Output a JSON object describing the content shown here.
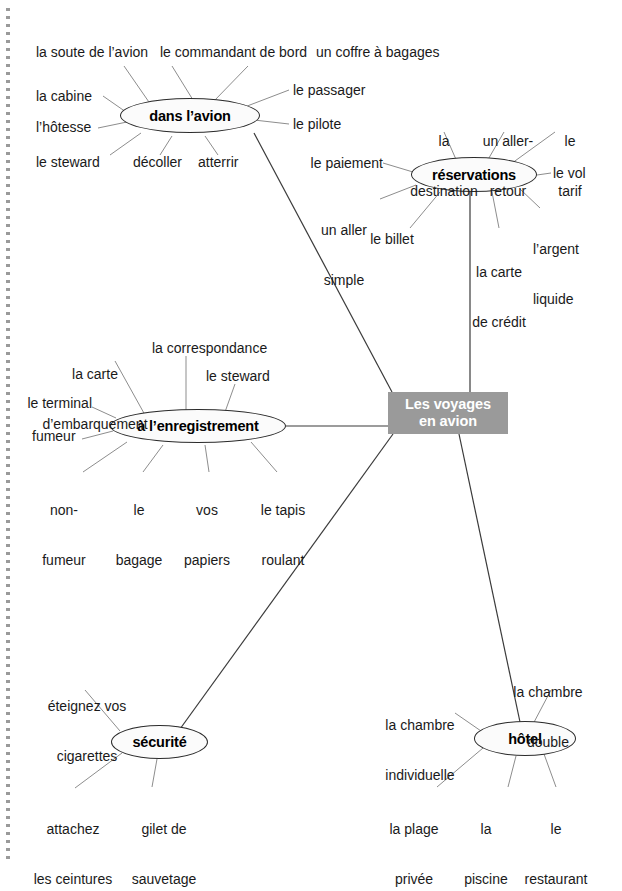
{
  "diagram": {
    "title_node": {
      "label": "Les voyages\nen avion",
      "line1": "Les voyages",
      "line2": "en avion",
      "color": "#9a9a9a",
      "text_color": "#ffffff"
    },
    "branches": [
      {
        "id": "dans-lavion",
        "label": "dans l’avion",
        "leaves": [
          {
            "text": "la soute de l’avion"
          },
          {
            "text": "le commandant de bord"
          },
          {
            "text": "un coffre à bagages"
          },
          {
            "text": "la cabine"
          },
          {
            "text": "l’hôtesse"
          },
          {
            "text": "le steward"
          },
          {
            "text": "décoller"
          },
          {
            "text": "atterrir"
          },
          {
            "text": "le passager"
          },
          {
            "text": "le pilote"
          }
        ]
      },
      {
        "id": "reservations",
        "label": "réservations",
        "leaves": [
          {
            "text": "la\ndestination",
            "line1": "la",
            "line2": "destination"
          },
          {
            "text": "un aller-\nretour",
            "line1": "un aller-",
            "line2": "retour"
          },
          {
            "text": "le\ntarif",
            "line1": "le",
            "line2": "tarif"
          },
          {
            "text": "le paiement"
          },
          {
            "text": "un aller\nsimple",
            "line1": "un aller",
            "line2": "simple"
          },
          {
            "text": "le billet"
          },
          {
            "text": "la carte\nde crédit",
            "line1": "la carte",
            "line2": "de crédit"
          },
          {
            "text": "l’argent\nliquide",
            "line1": "l’argent",
            "line2": "liquide"
          },
          {
            "text": "le vol"
          }
        ]
      },
      {
        "id": "a-lenregistrement",
        "label": "à l’enregistrement",
        "leaves": [
          {
            "text": "la carte\nd’embarquement",
            "line1": "la carte",
            "line2": "d’embarquement"
          },
          {
            "text": "la correspondance"
          },
          {
            "text": "le steward"
          },
          {
            "text": "le terminal"
          },
          {
            "text": "fumeur"
          },
          {
            "text": "non-\nfumeur",
            "line1": "non-",
            "line2": "fumeur"
          },
          {
            "text": "le\nbagage",
            "line1": "le",
            "line2": "bagage"
          },
          {
            "text": "vos\npapiers",
            "line1": "vos",
            "line2": "papiers"
          },
          {
            "text": "le tapis\nroulant",
            "line1": "le tapis",
            "line2": "roulant"
          }
        ]
      },
      {
        "id": "securite",
        "label": "sécurité",
        "leaves": [
          {
            "text": "éteignez vos\ncigarettes",
            "line1": "éteignez vos",
            "line2": "cigarettes"
          },
          {
            "text": "attachez\nles ceintures",
            "line1": "attachez",
            "line2": "les ceintures"
          },
          {
            "text": "gilet de\nsauvetage",
            "line1": "gilet de",
            "line2": "sauvetage"
          }
        ]
      },
      {
        "id": "hotel",
        "label": "hôtel",
        "leaves": [
          {
            "text": "la chambre\ndouble",
            "line1": "la chambre",
            "line2": "double"
          },
          {
            "text": "la chambre\nindividuelle",
            "line1": "la chambre",
            "line2": "individuelle"
          },
          {
            "text": "la plage\nprivée",
            "line1": "la plage",
            "line2": "privée"
          },
          {
            "text": "la\npiscine",
            "line1": "la",
            "line2": "piscine"
          },
          {
            "text": "le\nrestaurant",
            "line1": "le",
            "line2": "restaurant"
          }
        ]
      }
    ]
  }
}
